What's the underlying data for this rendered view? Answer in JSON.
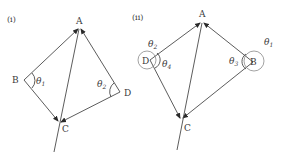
{
  "diagrams": [
    {
      "label": "(i)",
      "points": {
        "A": {
          "label": "A",
          "x": 79,
          "y": 28
        },
        "B": {
          "label": "B",
          "x": 24,
          "y": 80
        },
        "C": {
          "label": "C",
          "x": 59,
          "y": 122
        },
        "D": {
          "label": "D",
          "x": 120,
          "y": 92
        }
      },
      "angles": [
        {
          "label": "θ",
          "sub": "1",
          "at": "B"
        },
        {
          "label": "θ",
          "sub": "2",
          "at": "D"
        }
      ]
    },
    {
      "label": "(ii)",
      "points": {
        "A": {
          "label": "A",
          "x": 202,
          "y": 22
        },
        "B": {
          "label": "B",
          "x": 253,
          "y": 62
        },
        "C": {
          "label": "C",
          "x": 181,
          "y": 119
        },
        "D": {
          "label": "D",
          "x": 150,
          "y": 60
        }
      },
      "angles": [
        {
          "label": "θ",
          "sub": "1",
          "at": "B-outer"
        },
        {
          "label": "θ",
          "sub": "2",
          "at": "D-outer"
        },
        {
          "label": "θ",
          "sub": "3",
          "at": "B-inner"
        },
        {
          "label": "θ",
          "sub": "4",
          "at": "D-inner"
        }
      ]
    }
  ]
}
